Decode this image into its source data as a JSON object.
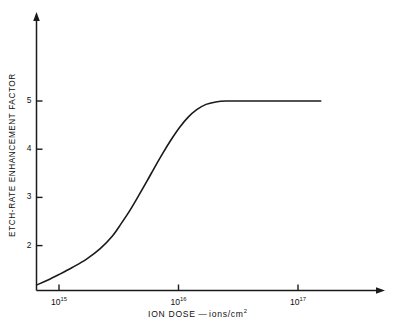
{
  "figure": {
    "background_color": "#ffffff",
    "ink_color": "#1a1a1a"
  },
  "chart_data": {
    "type": "line",
    "title": "",
    "subtitle": "",
    "xlabel": "ION DOSE — ions/cm2",
    "xlabel_parts": {
      "name": "ION DOSE",
      "dash": "—",
      "units_base": "ions/cm",
      "units_exponent": "2"
    },
    "ylabel": "ETCH-RATE ENHANCEMENT FACTOR",
    "xscale": "log",
    "yscale": "linear",
    "xlim": [
      600000000000000.0,
      1.7e+17
    ],
    "ylim": [
      1.0,
      6.0
    ],
    "grid": false,
    "legend": null,
    "annotations": [],
    "x_ticks": [
      {
        "value": 1000000000000000.0,
        "base": "10",
        "exponent": "15",
        "label": "1015"
      },
      {
        "value": 1e+16,
        "base": "10",
        "exponent": "16",
        "label": "1016"
      },
      {
        "value": 1e+17,
        "base": "10",
        "exponent": "17",
        "label": "1017"
      }
    ],
    "y_ticks": [
      {
        "value": 2,
        "label": "2"
      },
      {
        "value": 3,
        "label": "3"
      },
      {
        "value": 4,
        "label": "4"
      },
      {
        "value": 5,
        "label": "5"
      }
    ],
    "series": [
      {
        "name": "etch-rate enhancement",
        "color": "#1a1a1a",
        "line_width": 1.6,
        "points": [
          {
            "x": 660000000000000.0,
            "y": 1.19
          },
          {
            "x": 800000000000000.0,
            "y": 1.28
          },
          {
            "x": 1000000000000000.0,
            "y": 1.4
          },
          {
            "x": 1300000000000000.0,
            "y": 1.55
          },
          {
            "x": 1700000000000000.0,
            "y": 1.72
          },
          {
            "x": 2200000000000000.0,
            "y": 1.93
          },
          {
            "x": 2800000000000000.0,
            "y": 2.2
          },
          {
            "x": 3300000000000000.0,
            "y": 2.45
          },
          {
            "x": 3900000000000000.0,
            "y": 2.72
          },
          {
            "x": 4600000000000000.0,
            "y": 3.02
          },
          {
            "x": 5400000000000000.0,
            "y": 3.32
          },
          {
            "x": 6300000000000000.0,
            "y": 3.62
          },
          {
            "x": 7400000000000000.0,
            "y": 3.92
          },
          {
            "x": 8700000000000000.0,
            "y": 4.2
          },
          {
            "x": 1.02e+16,
            "y": 4.45
          },
          {
            "x": 1.2e+16,
            "y": 4.66
          },
          {
            "x": 1.42e+16,
            "y": 4.82
          },
          {
            "x": 1.7e+16,
            "y": 4.93
          },
          {
            "x": 2.05e+16,
            "y": 4.98
          },
          {
            "x": 2.5e+16,
            "y": 5.0
          },
          {
            "x": 3.5e+16,
            "y": 5.0
          },
          {
            "x": 6e+16,
            "y": 5.0
          },
          {
            "x": 1e+17,
            "y": 5.0
          },
          {
            "x": 1.55e+17,
            "y": 5.0
          }
        ]
      }
    ],
    "saturation_value": 5.0,
    "axis_style": {
      "arrow_heads": true,
      "spines": [
        "left",
        "bottom"
      ]
    }
  }
}
